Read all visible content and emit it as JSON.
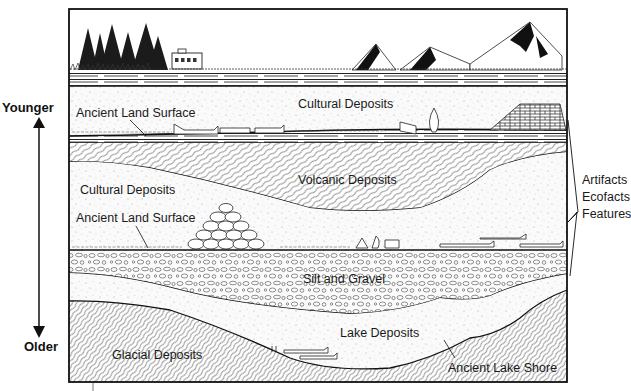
{
  "timeline": {
    "top_label": "Younger",
    "bottom_label": "Older"
  },
  "landscape": {
    "features": [
      "trees",
      "house",
      "grass",
      "mountains"
    ]
  },
  "layers": [
    {
      "id": "topsoil",
      "label": ""
    },
    {
      "id": "cultural-deposits-upper",
      "label": "Cultural Deposits"
    },
    {
      "id": "ancient-land-surface-upper",
      "label": "Ancient Land Surface"
    },
    {
      "id": "volcanic-deposits",
      "label": "Volcanic Deposits"
    },
    {
      "id": "cultural-deposits-lower",
      "label": "Cultural Deposits"
    },
    {
      "id": "ancient-land-surface-lower",
      "label": "Ancient Land Surface"
    },
    {
      "id": "silt-and-gravel",
      "label": "Silt and Gravel"
    },
    {
      "id": "lake-deposits",
      "label": "Lake Deposits"
    },
    {
      "id": "glacial-deposits",
      "label": "Glacial Deposits"
    },
    {
      "id": "ancient-lake-shore",
      "label": "Ancient Lake Shore"
    }
  ],
  "bracket": {
    "items": [
      "Artifacts",
      "Ecofacts",
      "Features"
    ]
  },
  "colors": {
    "ink": "#111111",
    "paper": "#ffffff",
    "fill": "#f7f7f7"
  }
}
